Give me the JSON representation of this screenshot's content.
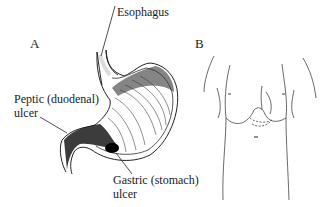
{
  "figure": {
    "panel_a": {
      "letter": "A",
      "labels": {
        "esophagus": "Esophagus",
        "peptic_line1": "Peptic (duodenal)",
        "peptic_line2": "ulcer",
        "gastric_line1": "Gastric (stomach)",
        "gastric_line2": "ulcer"
      }
    },
    "panel_b": {
      "letter": "B"
    }
  }
}
